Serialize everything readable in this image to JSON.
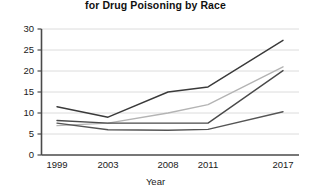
{
  "chart_data": {
    "type": "line",
    "title": "for Drug Poisoning by Race",
    "xlabel": "Year",
    "ylabel": "",
    "x": [
      1999,
      2003,
      2008,
      2011,
      2017
    ],
    "categories": [
      "1999",
      "2003",
      "2008",
      "2011",
      "2017"
    ],
    "xtick_labels": [
      "1999",
      "2003",
      "2008",
      "2011",
      "2017"
    ],
    "ytick_labels": [
      "0",
      "5",
      "10",
      "15",
      "20",
      "25",
      "30"
    ],
    "yticks": [
      0,
      5,
      10,
      15,
      20,
      25,
      30
    ],
    "ylim": [
      0,
      30
    ],
    "grid": "horizontal",
    "legend": "none",
    "series": [
      {
        "name": "series-1",
        "color": "#3a3a3a",
        "values": [
          11.5,
          9.0,
          15.0,
          16.2,
          27.3
        ]
      },
      {
        "name": "series-2",
        "color": "#b4b4b4",
        "values": [
          7.0,
          7.6,
          10.0,
          12.0,
          21.0
        ]
      },
      {
        "name": "series-3",
        "color": "#4a4a4a",
        "values": [
          8.2,
          7.6,
          7.6,
          7.6,
          20.1
        ]
      },
      {
        "name": "series-4",
        "color": "#555555",
        "values": [
          7.6,
          6.0,
          5.9,
          6.1,
          10.3
        ]
      }
    ]
  }
}
